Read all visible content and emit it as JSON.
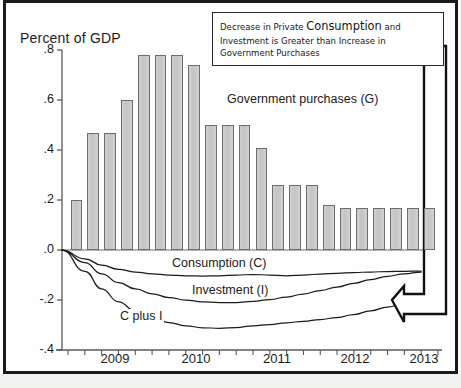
{
  "chart_data": {
    "type": "bar",
    "title": "Percent of GDP",
    "xlabel": "",
    "ylabel": "Percent of GDP",
    "ylim": [
      -0.4,
      0.8
    ],
    "yticks": [
      ".8",
      ".6",
      ".4",
      ".2",
      ".0",
      "-.2",
      "-.4"
    ],
    "ytick_values": [
      0.8,
      0.6,
      0.4,
      0.2,
      0.0,
      -0.2,
      -0.4
    ],
    "xticks": [
      "2009",
      "2010",
      "2011",
      "2012",
      "2013"
    ],
    "xtick_values": [
      2009,
      2010,
      2011,
      2012,
      2013
    ],
    "grid": false,
    "legend_position": "inline-annotations",
    "bar_series": {
      "name": "Government purchases (G)",
      "label": "Government purchases (G)",
      "color": "#c9c9c9",
      "edge_color": "#6d6d6d",
      "categories": [
        "2008Q4",
        "2009Q1",
        "2009Q2",
        "2009Q3",
        "2009Q4",
        "2010Q1",
        "2010Q2",
        "2010Q3",
        "2010Q4",
        "2011Q1",
        "2011Q2",
        "2011Q3",
        "2011Q4",
        "2012Q1",
        "2012Q2",
        "2012Q3",
        "2012Q4",
        "2013Q1",
        "2013Q2",
        "2013Q3",
        "2013Q4",
        "2014Q1"
      ],
      "values": [
        0.2,
        0.47,
        0.47,
        0.6,
        0.78,
        0.78,
        0.78,
        0.74,
        0.5,
        0.5,
        0.5,
        0.41,
        0.26,
        0.26,
        0.26,
        0.18,
        0.17,
        0.17,
        0.17,
        0.17,
        0.17,
        0.17
      ]
    },
    "line_series": [
      {
        "name": "Consumption (C)",
        "label": "Consumption (C)",
        "color": "#1b1b1b",
        "values": [
          0.0,
          -0.035,
          -0.06,
          -0.077,
          -0.088,
          -0.095,
          -0.1,
          -0.103,
          -0.104,
          -0.103,
          -0.1,
          -0.098,
          -0.1,
          -0.103,
          -0.1,
          -0.096,
          -0.093,
          -0.09,
          -0.088,
          -0.086,
          -0.085,
          -0.084
        ]
      },
      {
        "name": "Investment (I)",
        "label": "Investment (I)",
        "color": "#1b1b1b",
        "values": [
          0.0,
          -0.05,
          -0.095,
          -0.13,
          -0.155,
          -0.175,
          -0.19,
          -0.2,
          -0.207,
          -0.21,
          -0.21,
          -0.205,
          -0.198,
          -0.188,
          -0.176,
          -0.162,
          -0.148,
          -0.133,
          -0.118,
          -0.105,
          -0.095,
          -0.088
        ]
      },
      {
        "name": "C plus I",
        "label": "C plus I",
        "color": "#1b1b1b",
        "values": [
          0.0,
          -0.085,
          -0.155,
          -0.207,
          -0.243,
          -0.27,
          -0.29,
          -0.303,
          -0.311,
          -0.313,
          -0.31,
          -0.303,
          -0.298,
          -0.291,
          -0.285,
          -0.278,
          -0.27,
          -0.258,
          -0.243,
          -0.228,
          -0.214,
          -0.203
        ]
      }
    ],
    "annotations": [
      {
        "name": "callout-box",
        "text_part_1": "Decrease in Private ",
        "text_emphasis": "Consumption",
        "text_part_2": " and Investment is Greater than Increase in Government Purchases",
        "points_to": "C plus I"
      }
    ]
  },
  "axis": {
    "title": "Percent of GDP"
  }
}
